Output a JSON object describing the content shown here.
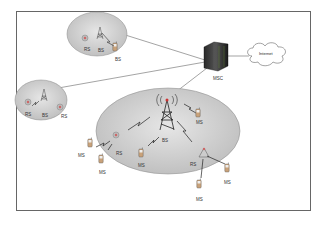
{
  "diagram": {
    "type": "cellular-network-architecture",
    "core": {
      "msc": {
        "label": "MSC"
      },
      "internet": {
        "label": "Internet"
      }
    },
    "cells": [
      {
        "id": "cell-top",
        "label": "BS",
        "nodes": [
          {
            "label": "RS"
          },
          {
            "label": "BS"
          },
          {
            "label": "RS"
          }
        ]
      },
      {
        "id": "cell-left",
        "nodes": [
          {
            "label": "RS"
          },
          {
            "label": "BS"
          },
          {
            "label": "RS"
          }
        ]
      },
      {
        "id": "cell-main",
        "bs_label": "BS",
        "nodes": [
          {
            "label": "RS"
          },
          {
            "label": "RS"
          },
          {
            "label": "MS"
          },
          {
            "label": "MS"
          },
          {
            "label": "MS"
          },
          {
            "label": "MS"
          },
          {
            "label": "MS"
          },
          {
            "label": "MS"
          }
        ]
      }
    ],
    "labels": {
      "msc": "MSC",
      "internet": "Internet",
      "top_bs": "BS",
      "top_rs1": "RS",
      "top_bs_small": "BS",
      "top_rs2": "RS",
      "left_rs1": "RS",
      "left_bs": "BS",
      "left_rs2": "RS",
      "main_bs": "BS",
      "main_rs_left": "RS",
      "main_rs_right": "RS",
      "ms_right_top": "MS",
      "ms_left": "MS",
      "ms_left_bottom": "MS",
      "ms_center": "MS",
      "ms_right": "MS",
      "ms_bottom": "MS"
    }
  }
}
